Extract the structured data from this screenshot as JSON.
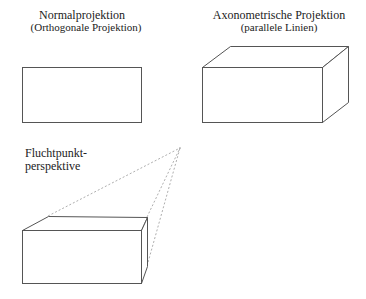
{
  "panels": {
    "normal": {
      "title": "Normalprojektion",
      "subtitle": "(Orthogonale Projektion)"
    },
    "axonometric": {
      "title": "Axonometrische Projektion",
      "subtitle": "(parallele Linien)"
    },
    "perspective": {
      "title_line1": "Fluchtpunkt-",
      "title_line2": "perspektive"
    }
  },
  "colors": {
    "line": "#555555",
    "dashed": "#999999",
    "text": "#222222",
    "background": "#ffffff"
  }
}
